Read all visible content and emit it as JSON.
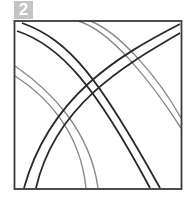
{
  "step": {
    "number": "2"
  },
  "diagram": {
    "colors": {
      "frame": "#3a3a3a",
      "main_bands": "#2a2a2a",
      "background_curves": "#8a8a8a",
      "badge": "#c4c4c4"
    }
  }
}
